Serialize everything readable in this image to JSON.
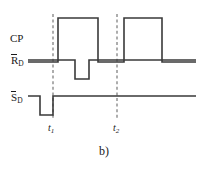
{
  "figure": {
    "caption": "b)",
    "background_color": "#ffffff",
    "trace_color": "#3a3a3a",
    "marker_color": "#6b6b6b",
    "text_color": "#1a1a1a"
  },
  "signals": [
    {
      "id": "cp",
      "name": "CP",
      "label_base": "CP",
      "label_overbar": false,
      "label_subscript": "",
      "baseline_y": 40,
      "high_y": 18,
      "idle_level": "low",
      "transitions": [
        {
          "x": 58,
          "to": "high"
        },
        {
          "x": 98,
          "to": "low"
        },
        {
          "x": 124,
          "to": "high"
        },
        {
          "x": 162,
          "to": "low"
        }
      ]
    },
    {
      "id": "rd",
      "name": "RD-not",
      "label_base": "R",
      "label_overbar": true,
      "label_subscript": "D",
      "baseline_y": 60,
      "high_y": 60,
      "low_y": 79,
      "idle_level": "high",
      "transitions": [
        {
          "x": 75,
          "to": "low"
        },
        {
          "x": 89,
          "to": "high"
        }
      ]
    },
    {
      "id": "sd",
      "name": "SD-not",
      "label_base": "S",
      "label_overbar": true,
      "label_subscript": "D",
      "baseline_y": 96,
      "high_y": 96,
      "low_y": 115,
      "idle_level": "high",
      "transitions": [
        {
          "x": 40,
          "to": "low"
        },
        {
          "x": 53,
          "to": "high"
        }
      ]
    }
  ],
  "time_markers": [
    {
      "id": "t1",
      "base": "t",
      "subscript": "1",
      "x": 53,
      "y_top": 14,
      "y_bottom": 120
    },
    {
      "id": "t2",
      "base": "t",
      "subscript": "2",
      "x": 117,
      "y_top": 14,
      "y_bottom": 120
    }
  ],
  "geometry": {
    "trace_start_x": 28,
    "trace_end_x": 196,
    "stroke_width": 1.6,
    "dash_pattern": "3,2.6",
    "dash_width": 1.1
  }
}
